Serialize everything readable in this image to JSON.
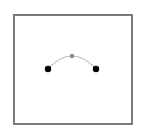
{
  "diagram": {
    "frame": {
      "x": 13,
      "y": 14,
      "width": 118,
      "height": 109,
      "border_color": "#7a7a7a"
    },
    "arc": {
      "color": "#bdbdbd",
      "width": 1.2
    },
    "points": [
      {
        "id": "left-endpoint",
        "x": 48,
        "y": 69,
        "r": 3.2,
        "color": "#000000"
      },
      {
        "id": "control-point",
        "x": 72,
        "y": 56,
        "r": 2.2,
        "color": "#8a8a8a"
      },
      {
        "id": "right-endpoint",
        "x": 96,
        "y": 69,
        "r": 3.2,
        "color": "#000000"
      }
    ]
  }
}
